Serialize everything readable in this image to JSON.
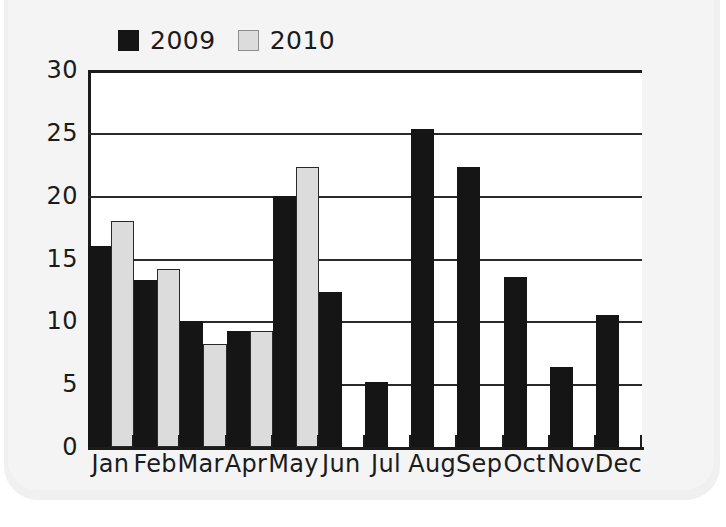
{
  "chart_data": {
    "type": "bar",
    "title": "",
    "xlabel": "",
    "ylabel": "",
    "categories": [
      "Jan",
      "Feb",
      "Mar",
      "Apr",
      "May",
      "Jun",
      "Jul",
      "Aug",
      "Sep",
      "Oct",
      "Nov",
      "Dec"
    ],
    "series": [
      {
        "name": "2009",
        "color": "#151515",
        "values": [
          16.0,
          13.3,
          10.0,
          9.2,
          20.0,
          12.3,
          5.2,
          25.3,
          22.3,
          13.5,
          6.4,
          10.5
        ]
      },
      {
        "name": "2010",
        "color": "#dcdcdc",
        "values": [
          18.0,
          14.2,
          8.2,
          9.2,
          22.3,
          null,
          null,
          null,
          null,
          null,
          null,
          null
        ]
      }
    ],
    "ylim": [
      0,
      30
    ],
    "yticks": [
      0,
      5,
      10,
      15,
      20,
      25,
      30
    ],
    "ytick_labels": [
      "0",
      "5",
      "10",
      "15",
      "20",
      "25",
      "30"
    ],
    "grid": true,
    "legend_position": "top-left"
  },
  "legend": {
    "items": [
      {
        "label": "2009",
        "swatch": "dark-square-swatch"
      },
      {
        "label": "2010",
        "swatch": "light-square-swatch"
      }
    ]
  },
  "colors": {
    "series_2009": "#151515",
    "series_2010": "#dcdcdc",
    "axis": "#1b1b1b",
    "grid": "#2a2a2a",
    "plot_background": "#ffffff",
    "page_background": "#f0f0f0"
  }
}
